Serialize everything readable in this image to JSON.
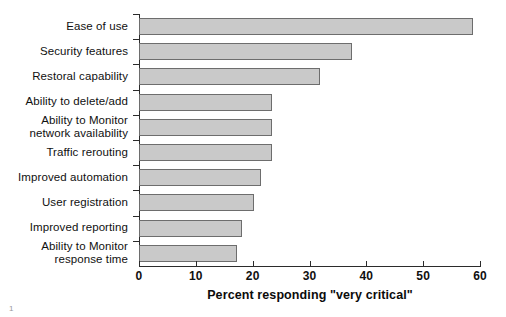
{
  "chart_data": {
    "type": "bar",
    "orientation": "horizontal",
    "title": "",
    "xlabel": "Percent responding \"very critical\"",
    "ylabel": "",
    "xlim": [
      0,
      60
    ],
    "xticks": [
      0,
      10,
      20,
      30,
      40,
      50,
      60
    ],
    "xticklabels": [
      "0",
      "10",
      "20",
      "30",
      "40",
      "50",
      "60"
    ],
    "grid": false,
    "legend": null,
    "bar_color": "#c9c9c9",
    "bar_edge_color": "#6d6d6d",
    "categories": [
      "Ease of use",
      "Security features",
      "Restoral capability",
      "Ability to delete/add",
      "Ability to Monitor\nnetwork availability",
      "Traffic rerouting",
      "Improved automation",
      "User registration",
      "Improved reporting",
      "Ability to Monitor\nresponse time"
    ],
    "category_lines": [
      [
        "Ease of use"
      ],
      [
        "Security features"
      ],
      [
        "Restoral capability"
      ],
      [
        "Ability to delete/add"
      ],
      [
        "Ability to Monitor",
        "network availability"
      ],
      [
        "Traffic rerouting"
      ],
      [
        "Improved automation"
      ],
      [
        "User registration"
      ],
      [
        "Improved reporting"
      ],
      [
        "Ability to Monitor",
        "response time"
      ]
    ],
    "values": [
      58.8,
      37.5,
      31.8,
      23.4,
      23.4,
      23.4,
      21.5,
      20.2,
      18.1,
      17.2
    ]
  },
  "footer": {
    "page_mark": "1"
  }
}
